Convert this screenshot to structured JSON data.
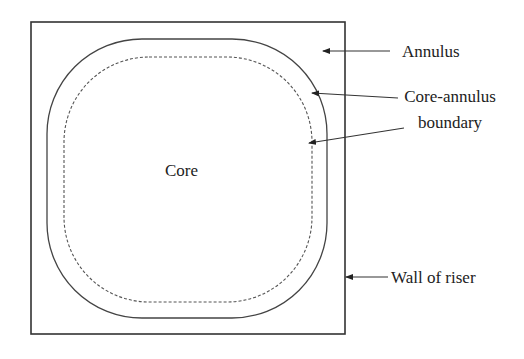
{
  "figure": {
    "type": "cross-section schematic of riser",
    "colors": {
      "line": "#333333",
      "text": "#222222",
      "background": "#ffffff"
    }
  },
  "labels": {
    "core": "Core",
    "annulus": "Annulus",
    "boundary_line1": "Core-annulus",
    "boundary_line2": "boundary",
    "wall": "Wall of riser"
  },
  "shapes": {
    "wall": {
      "x": 31,
      "y": 22,
      "w": 314,
      "h": 312,
      "style": "solid"
    },
    "outer_boundary": {
      "x": 47,
      "y": 39,
      "w": 280,
      "h": 279,
      "rx": 95,
      "style": "solid"
    },
    "inner_boundary": {
      "x": 64,
      "y": 57,
      "w": 248,
      "h": 245,
      "rx": 85,
      "style": "dashed"
    }
  }
}
